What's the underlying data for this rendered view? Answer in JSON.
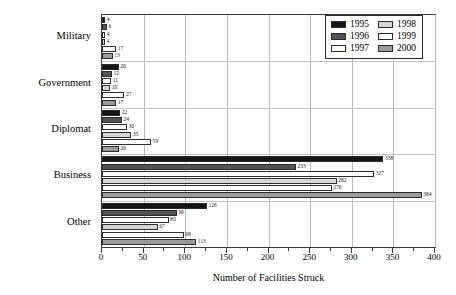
{
  "chart_data": {
    "type": "bar",
    "orientation": "horizontal",
    "title": "",
    "xlabel": "Number of Facilities Struck",
    "ylabel": "",
    "xlim": [
      0,
      400
    ],
    "xticks": [
      0,
      50,
      100,
      150,
      200,
      250,
      300,
      350,
      400
    ],
    "xtick_labels": [
      "0",
      "50",
      "100",
      "150",
      "200",
      "250",
      "300",
      "350",
      "400"
    ],
    "minor_tick_step": 25,
    "grid": "vertical",
    "legend_position": "top-right",
    "categories": [
      "Military",
      "Government",
      "Diplomat",
      "Business",
      "Other"
    ],
    "series": [
      {
        "name": "1995",
        "color": "#141414",
        "values": [
          4,
          20,
          22,
          338,
          126
        ]
      },
      {
        "name": "1996",
        "color": "#535353",
        "values": [
          6,
          12,
          24,
          233,
          90
        ]
      },
      {
        "name": "1997",
        "color": "#ffffff",
        "values": [
          4,
          11,
          30,
          327,
          80
        ]
      },
      {
        "name": "1998",
        "color": "#d5d5d5",
        "values": [
          4,
          10,
          35,
          282,
          67
        ]
      },
      {
        "name": "1999",
        "color": "#ffffff",
        "values": [
          17,
          27,
          59,
          276,
          98
        ]
      },
      {
        "name": "2000",
        "color": "#9b9b9b",
        "values": [
          13,
          17,
          20,
          384,
          113
        ]
      }
    ]
  },
  "legend": {
    "entries": [
      {
        "label": "1995",
        "color": "#141414"
      },
      {
        "label": "1998",
        "color": "#d5d5d5"
      },
      {
        "label": "1996",
        "color": "#535353"
      },
      {
        "label": "1999",
        "color": "#ffffff"
      },
      {
        "label": "1997",
        "color": "#ffffff"
      },
      {
        "label": "2000",
        "color": "#9b9b9b"
      }
    ]
  },
  "axis": {
    "x_title": "Number of Facilities Struck",
    "tick_labels": [
      "0",
      "50",
      "100",
      "150",
      "200",
      "250",
      "300",
      "350",
      "400"
    ]
  },
  "category_labels": [
    "Military",
    "Government",
    "Diplomat",
    "Business",
    "Other"
  ]
}
